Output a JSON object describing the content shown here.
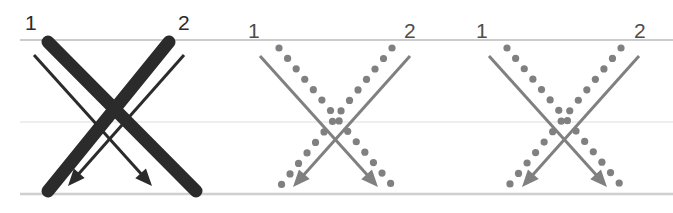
{
  "figure": {
    "width": 673,
    "height": 213,
    "background": "#ffffff"
  },
  "colors": {
    "dark": "#2b2b2b",
    "gray": "#808080",
    "gray_label": "#4d4d4d",
    "gridline": "#d9d9d9",
    "gridline_mid": "#e6e6e6",
    "background": "#ffffff"
  },
  "gridlines": [
    {
      "name": "top-line",
      "y": 40,
      "x1": 20,
      "x2": 673,
      "color": "#cccccc",
      "width": 2.2
    },
    {
      "name": "middle-line",
      "y": 122,
      "x1": 20,
      "x2": 673,
      "color": "#e8e8e8",
      "width": 1.6
    },
    {
      "name": "bottom-line",
      "y": 194,
      "x1": 20,
      "x2": 673,
      "color": "#cfcfcf",
      "width": 2.4
    }
  ],
  "panels": [
    {
      "id": "panel-1",
      "style": "thick-dark",
      "labels": [
        {
          "text": "1",
          "x": 25,
          "y": 30,
          "color": "#2b2b2b"
        },
        {
          "text": "2",
          "x": 178,
          "y": 30,
          "color": "#2b2b2b"
        }
      ],
      "thick_lines": [
        {
          "name": "thick-1-to-right",
          "x1": 48,
          "y1": 42,
          "x2": 196,
          "y2": 191,
          "width": 13,
          "color": "#2b2b2b"
        },
        {
          "name": "thick-2-to-left",
          "x1": 169,
          "y1": 42,
          "x2": 48,
          "y2": 191,
          "width": 13,
          "color": "#2b2b2b"
        }
      ],
      "arrows": [
        {
          "name": "arrow-1-to-right",
          "x1": 34,
          "y1": 55,
          "x2": 152,
          "y2": 186,
          "width": 3,
          "color": "#2b2b2b"
        },
        {
          "name": "arrow-2-to-left",
          "x1": 184,
          "y1": 55,
          "x2": 68,
          "y2": 186,
          "width": 3,
          "color": "#2b2b2b"
        }
      ]
    },
    {
      "id": "panel-2",
      "style": "gray-dotted",
      "labels": [
        {
          "text": "1",
          "x": 248,
          "y": 38,
          "color": "#4d4d4d"
        },
        {
          "text": "2",
          "x": 404,
          "y": 38,
          "color": "#4d4d4d"
        }
      ],
      "dotted_lines": [
        {
          "name": "dotted-1-to-right",
          "x1": 279,
          "y1": 48,
          "x2": 396,
          "y2": 190,
          "dot_radius": 3.6,
          "spacing": 13.5,
          "color": "#808080"
        },
        {
          "name": "dotted-2-to-left",
          "x1": 392,
          "y1": 48,
          "x2": 277,
          "y2": 190,
          "dot_radius": 3.6,
          "spacing": 13.5,
          "color": "#808080"
        }
      ],
      "arrows": [
        {
          "name": "arrow-1-to-right",
          "x1": 260,
          "y1": 56,
          "x2": 378,
          "y2": 187,
          "width": 3,
          "color": "#808080"
        },
        {
          "name": "arrow-2-to-left",
          "x1": 410,
          "y1": 56,
          "x2": 293,
          "y2": 187,
          "width": 3,
          "color": "#808080"
        }
      ]
    },
    {
      "id": "panel-3",
      "style": "gray-dotted",
      "labels": [
        {
          "text": "1",
          "x": 476,
          "y": 38,
          "color": "#4d4d4d"
        },
        {
          "text": "2",
          "x": 634,
          "y": 38,
          "color": "#4d4d4d"
        }
      ],
      "dotted_lines": [
        {
          "name": "dotted-1-to-right",
          "x1": 507,
          "y1": 48,
          "x2": 625,
          "y2": 190,
          "dot_radius": 3.6,
          "spacing": 13.5,
          "color": "#808080"
        },
        {
          "name": "dotted-2-to-left",
          "x1": 621,
          "y1": 48,
          "x2": 505,
          "y2": 190,
          "dot_radius": 3.6,
          "spacing": 13.5,
          "color": "#808080"
        }
      ],
      "arrows": [
        {
          "name": "arrow-1-to-right",
          "x1": 489,
          "y1": 56,
          "x2": 607,
          "y2": 187,
          "width": 3,
          "color": "#808080"
        },
        {
          "name": "arrow-2-to-left",
          "x1": 639,
          "y1": 56,
          "x2": 522,
          "y2": 187,
          "width": 3,
          "color": "#808080"
        }
      ]
    }
  ]
}
